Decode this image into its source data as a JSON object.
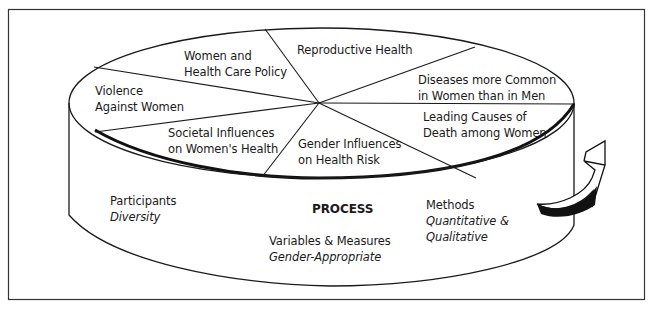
{
  "diagram": {
    "type": "cylinder-pie-process-diagram",
    "top_segments": [
      {
        "id": "women-health-care-policy",
        "lines": [
          "Women and",
          "Health Care Policy"
        ]
      },
      {
        "id": "reproductive-health",
        "lines": [
          "Reproductive Health"
        ]
      },
      {
        "id": "diseases-more-common",
        "lines": [
          "Diseases more Common",
          "in Women than in Men"
        ]
      },
      {
        "id": "leading-causes-death",
        "lines": [
          "Leading Causes of",
          "Death among Women"
        ]
      },
      {
        "id": "gender-influences",
        "lines": [
          "Gender Influences",
          "on Health Risk"
        ]
      },
      {
        "id": "societal-influences",
        "lines": [
          "Societal Influences",
          "on Women's Health"
        ]
      },
      {
        "id": "violence-against-women",
        "lines": [
          "Violence",
          "Against Women"
        ]
      }
    ],
    "side": {
      "center_label": "PROCESS",
      "participants": {
        "label": "Participants",
        "value": "Diversity"
      },
      "variables": {
        "label": "Variables & Measures",
        "value": "Gender-Appropriate"
      },
      "methods": {
        "label": "Methods",
        "value_lines": [
          "Quantitative &",
          "Qualitative"
        ]
      }
    },
    "arrow": "curved-rotation-arrow",
    "colors": {
      "line": "#1a1a1a",
      "background": "#ffffff"
    }
  }
}
